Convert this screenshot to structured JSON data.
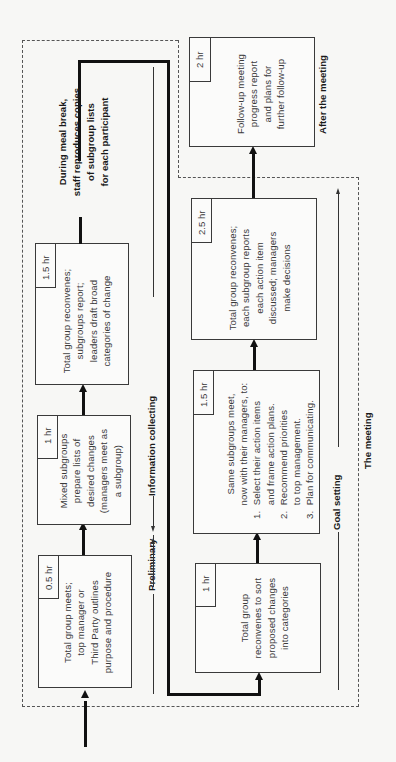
{
  "diagram": {
    "orientation": "rotated 90 degrees counter-clockwise",
    "steps": [
      {
        "id": 1,
        "duration": "0.5 hr",
        "lines": [
          "Total group meets;",
          "top manager or",
          "Third Party outlines",
          "purpose and procedure"
        ]
      },
      {
        "id": 2,
        "duration": "1 hr",
        "lines": [
          "Mixed subgroups",
          "prepare lists of",
          "desired changes",
          "(managers meet as",
          "a subgroup)"
        ]
      },
      {
        "id": 3,
        "duration": "1.5 hr",
        "lines": [
          "Total group reconvenes;",
          "subgroups report;",
          "leaders draft broad",
          "categories of change"
        ]
      },
      {
        "id": 4,
        "duration": "1 hr",
        "lines": [
          "Total group",
          "reconvenes to sort",
          "proposed changes",
          "into categories"
        ]
      },
      {
        "id": 5,
        "duration": "1.5 hr",
        "lines": [
          "Same subgroups meet,",
          "now with their managers, to:",
          "1.  Select their action items",
          "     and frame action plans.",
          "2.  Recommend priorities",
          "     to top management.",
          "3.  Plan for communicating."
        ]
      },
      {
        "id": 6,
        "duration": "2.5 hr",
        "lines": [
          "Total group reconvenes;",
          "each subgroup reports",
          "each action item",
          "discussed; managers",
          "make decisions"
        ]
      },
      {
        "id": 7,
        "duration": "2 hr",
        "lines": [
          "Follow-up meeting",
          "progress report",
          "and plans for",
          "further follow-up"
        ]
      }
    ],
    "meal_break_note": [
      "During meal break,",
      "staff reproduces copies",
      "of subgroup lists",
      "for each participant"
    ],
    "phases": {
      "preliminary": "Preliminary",
      "information_collecting": "Information collecting",
      "goal_setting": "Goal setting"
    },
    "regions": {
      "the_meeting": "The meeting",
      "after_the_meeting": "After the meeting"
    }
  }
}
